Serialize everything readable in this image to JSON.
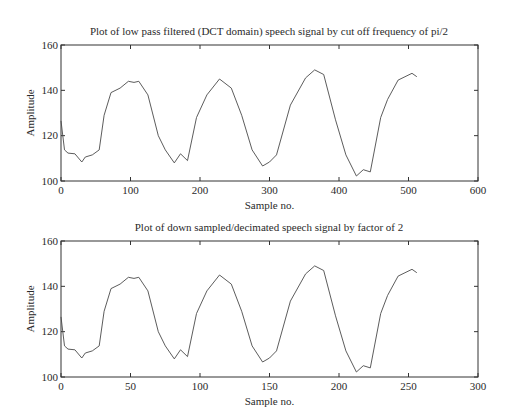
{
  "chart_data": [
    {
      "type": "line",
      "title": "Plot of low pass filtered (DCT domain) speech signal by cut off frequency of pi/2",
      "xlabel": "Sample no.",
      "ylabel": "Amplitude",
      "xlim": [
        0,
        600
      ],
      "ylim": [
        100,
        160
      ],
      "xticks": [
        0,
        100,
        200,
        300,
        400,
        500,
        600
      ],
      "yticks": [
        100,
        120,
        140,
        160
      ],
      "grid": false,
      "legend": null,
      "series": [
        {
          "name": "filtered signal",
          "x": [
            0,
            5,
            10,
            20,
            30,
            35,
            45,
            55,
            62,
            72,
            85,
            97,
            105,
            112,
            125,
            140,
            150,
            163,
            172,
            182,
            195,
            210,
            228,
            245,
            260,
            275,
            290,
            300,
            310,
            330,
            352,
            365,
            378,
            395,
            410,
            425,
            435,
            445,
            460,
            470,
            485,
            505,
            512
          ],
          "values": [
            126.5,
            113.7,
            112.3,
            112,
            108.4,
            110.6,
            111.5,
            113.7,
            129,
            139,
            141,
            144,
            143.5,
            144,
            138,
            120,
            113.7,
            108,
            112,
            109,
            128,
            138,
            145,
            141,
            129,
            113.7,
            106.6,
            108.4,
            111.5,
            133.5,
            145.5,
            149,
            147,
            127,
            111.5,
            102.2,
            105,
            104,
            128,
            136,
            144.5,
            147.5,
            146
          ]
        }
      ]
    },
    {
      "type": "line",
      "title": "Plot of down sampled/decimated speech signal by factor of 2",
      "xlabel": "Sample no.",
      "ylabel": "Amplitude",
      "xlim": [
        0,
        300
      ],
      "ylim": [
        100,
        160
      ],
      "xticks": [
        0,
        50,
        100,
        150,
        200,
        250,
        300
      ],
      "yticks": [
        100,
        120,
        140,
        160
      ],
      "grid": false,
      "legend": null,
      "series": [
        {
          "name": "decimated signal",
          "x": [
            0,
            2.5,
            5,
            10,
            15,
            17.5,
            22.5,
            27.5,
            31,
            36,
            42.5,
            48.5,
            52.5,
            56,
            62.5,
            70,
            75,
            81.5,
            86,
            91,
            97.5,
            105,
            114,
            122.5,
            130,
            137.5,
            145,
            150,
            155,
            165,
            176,
            182.5,
            189,
            197.5,
            205,
            212.5,
            217.5,
            222.5,
            230,
            235,
            242.5,
            252.5,
            256
          ],
          "values": [
            126.5,
            113.7,
            112.3,
            112,
            108.4,
            110.6,
            111.5,
            113.7,
            129,
            139,
            141,
            144,
            143.5,
            144,
            138,
            120,
            113.7,
            108,
            112,
            109,
            128,
            138,
            145,
            141,
            129,
            113.7,
            106.6,
            108.4,
            111.5,
            133.5,
            145.5,
            149,
            147,
            127,
            111.5,
            102.2,
            105,
            104,
            128,
            136,
            144.5,
            147.5,
            146
          ]
        }
      ]
    }
  ],
  "plots": [
    {
      "title": "Plot of low pass filtered (DCT domain) speech signal by cut off frequency of pi/2",
      "xlabel": "Sample no.",
      "ylabel": "Amplitude",
      "xtick_labels": [
        "0",
        "100",
        "200",
        "300",
        "400",
        "500",
        "600"
      ],
      "ytick_labels": [
        "100",
        "120",
        "140",
        "160"
      ]
    },
    {
      "title": "Plot of down sampled/decimated speech signal by factor of 2",
      "xlabel": "Sample no.",
      "ylabel": "Amplitude",
      "xtick_labels": [
        "0",
        "50",
        "100",
        "150",
        "200",
        "250",
        "300"
      ],
      "ytick_labels": [
        "100",
        "120",
        "140",
        "160"
      ]
    }
  ],
  "colors": {
    "line": "#4a4a4a",
    "axes": "#333333",
    "text": "#2a2a2a"
  }
}
